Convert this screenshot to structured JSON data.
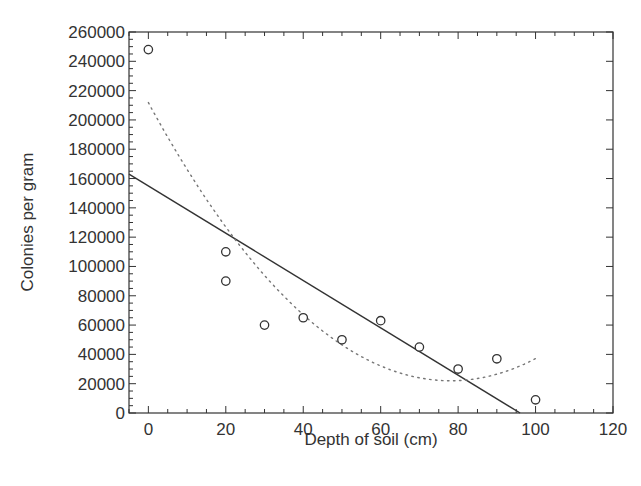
{
  "chart_data": {
    "type": "scatter",
    "title": "",
    "xlabel": "Depth of soil (cm)",
    "ylabel": "Colonies per gram",
    "xlim": [
      -5,
      120
    ],
    "ylim": [
      0,
      260000
    ],
    "x_ticks": [
      0,
      20,
      40,
      60,
      80,
      100,
      120
    ],
    "y_ticks": [
      0,
      20000,
      40000,
      60000,
      80000,
      100000,
      120000,
      140000,
      160000,
      180000,
      200000,
      220000,
      240000,
      260000
    ],
    "grid": false,
    "legend": null,
    "series": [
      {
        "name": "Observed colonies",
        "kind": "scatter",
        "marker": "open-circle",
        "points": [
          [
            0,
            248000
          ],
          [
            20,
            110000
          ],
          [
            20,
            90000
          ],
          [
            30,
            60000
          ],
          [
            40,
            65000
          ],
          [
            50,
            50000
          ],
          [
            60,
            63000
          ],
          [
            70,
            45000
          ],
          [
            80,
            30000
          ],
          [
            90,
            37000
          ],
          [
            100,
            9000
          ]
        ]
      },
      {
        "name": "Linear fit",
        "kind": "line",
        "style": "solid",
        "points": [
          [
            -5,
            163000
          ],
          [
            96,
            0
          ]
        ]
      },
      {
        "name": "Quadratic fit",
        "kind": "line",
        "style": "dotted",
        "points": [
          [
            0,
            212000
          ],
          [
            10,
            166000
          ],
          [
            20,
            127000
          ],
          [
            30,
            93000
          ],
          [
            40,
            66000
          ],
          [
            50,
            46000
          ],
          [
            60,
            32000
          ],
          [
            70,
            24000
          ],
          [
            78,
            22000
          ],
          [
            90,
            26500
          ],
          [
            100,
            37000
          ]
        ]
      }
    ]
  },
  "axes": {
    "x_title": "Depth of soil (cm)",
    "y_title": "Colonies per gram"
  }
}
